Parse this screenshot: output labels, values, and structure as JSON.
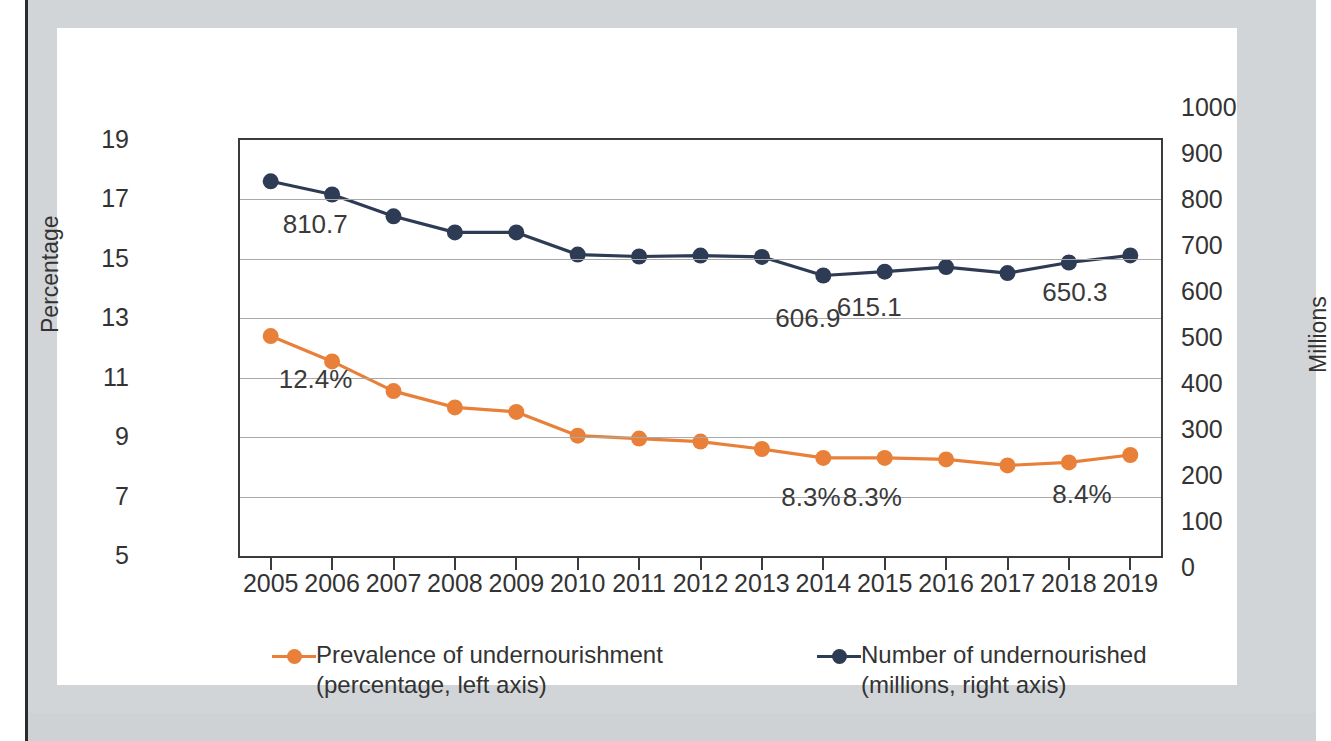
{
  "chart_data": {
    "type": "line",
    "title": "",
    "xlabel": "",
    "ylabel": "Percentage",
    "ylabel_right": "Millions",
    "grid": true,
    "legend_position": "bottom",
    "categories": [
      "2005",
      "2006",
      "2007",
      "2008",
      "2009",
      "2010",
      "2011",
      "2012",
      "2013",
      "2014",
      "2015",
      "2016",
      "2017",
      "2018",
      "2019"
    ],
    "yticks_left": [
      "19",
      "17",
      "15",
      "13",
      "11",
      "9",
      "7",
      "5"
    ],
    "ylim_left": [
      5,
      19
    ],
    "yticks_right": [
      "1000",
      "900",
      "800",
      "700",
      "600",
      "500",
      "400",
      "300",
      "200",
      "100",
      "0"
    ],
    "ylim_right": [
      0,
      1000
    ],
    "series": [
      {
        "name": "Prevalence of undernourishment",
        "sublabel": "(percentage, left axis)",
        "axis": "left",
        "color": "#E8803A",
        "values": [
          12.4,
          11.55,
          10.55,
          10.0,
          9.85,
          9.05,
          8.95,
          8.85,
          8.6,
          8.3,
          8.3,
          8.25,
          8.05,
          8.15,
          8.4
        ]
      },
      {
        "name": "Number of undernourished",
        "sublabel": "(millions, right axis)",
        "axis": "right",
        "color": "#2E3B55",
        "values": [
          810.7,
          782.0,
          735.0,
          700.0,
          700.0,
          652.0,
          648.0,
          650.0,
          647.0,
          606.9,
          615.1,
          625.0,
          612.0,
          635.0,
          650.3
        ]
      }
    ],
    "annotations": [
      {
        "text": "810.7",
        "series": "Number of undernourished",
        "category": "2005"
      },
      {
        "text": "606.9",
        "series": "Number of undernourished",
        "category": "2014"
      },
      {
        "text": "615.1",
        "series": "Number of undernourished",
        "category": "2015"
      },
      {
        "text": "650.3",
        "series": "Number of undernourished",
        "category": "2019"
      },
      {
        "text": "12.4%",
        "series": "Prevalence of undernourishment",
        "category": "2005"
      },
      {
        "text": "8.3%",
        "series": "Prevalence of undernourishment",
        "category": "2014"
      },
      {
        "text": "8.3%",
        "series": "Prevalence of undernourishment",
        "category": "2015"
      },
      {
        "text": "8.4%",
        "series": "Prevalence of undernourishment",
        "category": "2019"
      }
    ]
  },
  "axes": {
    "left_title": "Percentage",
    "right_title": "Millions"
  },
  "legend": {
    "items": [
      {
        "line1": "Prevalence of undernourishment",
        "line2": "(percentage, left axis)",
        "color": "#E8803A"
      },
      {
        "line1": "Number of undernourished",
        "line2": "(millions, right axis)",
        "color": "#2E3B55"
      }
    ]
  }
}
